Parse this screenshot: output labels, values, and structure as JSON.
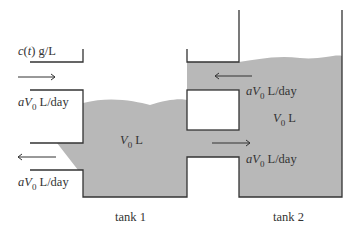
{
  "diagram": {
    "inlet_concentration": {
      "var": "c",
      "arg": "t",
      "unit": "g/L"
    },
    "inflow_rate": {
      "coef": "a",
      "var": "V",
      "sub": "0",
      "unit": "L/day"
    },
    "outflow_rate": {
      "coef": "a",
      "var": "V",
      "sub": "0",
      "unit": "L/day"
    },
    "tank1": {
      "label": "tank 1",
      "volume": {
        "var": "V",
        "sub": "0",
        "unit": "L"
      }
    },
    "tank2": {
      "label": "tank 2",
      "volume": {
        "var": "V",
        "sub": "0",
        "unit": "L"
      }
    },
    "upper_pipe_flow": {
      "coef": "a",
      "var": "V",
      "sub": "0",
      "unit": "L/day",
      "direction": "tank2-to-tank1"
    },
    "lower_pipe_flow": {
      "coef": "a",
      "var": "V",
      "sub": "0",
      "unit": "L/day",
      "direction": "tank1-to-tank2"
    },
    "colors": {
      "liquid": "#b8b8b8",
      "line": "#333333"
    }
  }
}
